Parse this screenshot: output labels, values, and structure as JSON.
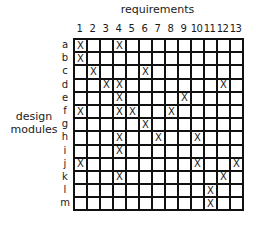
{
  "title": "requirements",
  "axis_label": [
    "design",
    "modules"
  ],
  "columns": [
    "1",
    "2",
    "3",
    "4",
    "5",
    "6",
    "7",
    "8",
    "9",
    "10",
    "11",
    "12",
    "13"
  ],
  "rows": [
    {
      "label": "a",
      "marks": [
        1,
        4
      ]
    },
    {
      "label": "b",
      "marks": [
        1
      ]
    },
    {
      "label": "c",
      "marks": [
        2,
        6
      ]
    },
    {
      "label": "d",
      "marks": [
        3,
        4,
        12
      ]
    },
    {
      "label": "e",
      "marks": [
        4,
        9
      ]
    },
    {
      "label": "f",
      "marks": [
        1,
        4,
        5,
        8
      ]
    },
    {
      "label": "g",
      "marks": [
        6
      ]
    },
    {
      "label": "h",
      "marks": [
        4,
        7,
        10
      ]
    },
    {
      "label": "i",
      "marks": [
        4
      ]
    },
    {
      "label": "j",
      "marks": [
        1,
        10,
        13
      ]
    },
    {
      "label": "k",
      "marks": [
        4,
        12
      ]
    },
    {
      "label": "l",
      "marks": [
        11
      ]
    },
    {
      "label": "m",
      "marks": [
        11
      ]
    }
  ],
  "mark_symbol": "X"
}
